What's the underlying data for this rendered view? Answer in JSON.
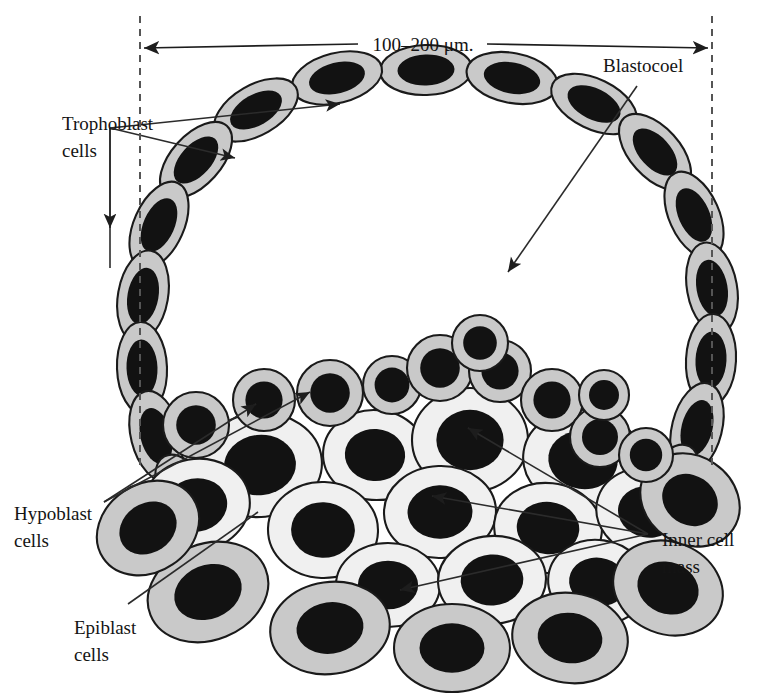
{
  "figure": {
    "background_color": "#ffffff"
  },
  "scale_bar": {
    "label": "100–200 μm.",
    "left_x": 140,
    "right_x": 712,
    "y": 48,
    "guide_left_x": 140,
    "guide_right_x": 712,
    "guide_top_y": 16,
    "guide_bottom_y": 470
  },
  "labels": {
    "trophoblast": {
      "line1": "Trophoblast",
      "line2": "cells",
      "x": 62,
      "y": 130
    },
    "blastocoel": {
      "line1": "Blastocoel",
      "x": 603,
      "y": 72
    },
    "hypoblast": {
      "line1": "Hypoblast",
      "line2": "cells",
      "x": 14,
      "y": 520
    },
    "epiblast": {
      "line1": "Epiblast",
      "line2": "cells",
      "x": 74,
      "y": 634
    },
    "inner_cell_mass": {
      "line1": "Inner cell",
      "line2": "mass",
      "x": 662,
      "y": 546
    }
  },
  "colors": {
    "cytoplasm_gray": "#c9c9c9",
    "cytoplasm_light": "#f0f0f0",
    "nucleus": "#121212",
    "outline": "#1a1a1a",
    "leader_line": "#2b2b2b",
    "dashed_guide": "#555555"
  },
  "chart_data": {
    "type": "diagram",
    "annotations": [
      "Trophoblast cells",
      "Blastocoel",
      "Hypoblast cells",
      "Epiblast cells",
      "Inner cell mass"
    ],
    "scale": "100–200 μm.",
    "structures": [
      {
        "name": "trophoblast",
        "count": 22,
        "cell_fill": "#c9c9c9",
        "shape": "tilted-ellipse-ring"
      },
      {
        "name": "blastocoel",
        "count": 1,
        "cell_fill": "#ffffff",
        "shape": "cavity"
      },
      {
        "name": "hypoblast",
        "count": 11,
        "cell_fill": "#c9c9c9",
        "shape": "small-round"
      },
      {
        "name": "inner-cell-mass",
        "count": 16,
        "cell_fill": "#f0f0f0",
        "shape": "large-round"
      },
      {
        "name": "epiblast",
        "count": 9,
        "cell_fill": "#c9c9c9",
        "shape": "large-ellipse"
      }
    ]
  },
  "trophoblast_cells": [
    {
      "cx": 426,
      "cy": 70,
      "rx": 46,
      "ry": 25,
      "rot": -2
    },
    {
      "cx": 512,
      "cy": 78,
      "rx": 46,
      "ry": 25,
      "rot": 11
    },
    {
      "cx": 594,
      "cy": 104,
      "rx": 46,
      "ry": 25,
      "rot": 26
    },
    {
      "cx": 655,
      "cy": 152,
      "rx": 46,
      "ry": 25,
      "rot": 48
    },
    {
      "cx": 694,
      "cy": 215,
      "rx": 46,
      "ry": 25,
      "rot": 66
    },
    {
      "cx": 712,
      "cy": 288,
      "rx": 46,
      "ry": 25,
      "rot": 80
    },
    {
      "cx": 711,
      "cy": 360,
      "rx": 46,
      "ry": 25,
      "rot": 93
    },
    {
      "cx": 697,
      "cy": 428,
      "rx": 46,
      "ry": 25,
      "rot": 104
    },
    {
      "cx": 668,
      "cy": 487,
      "rx": 46,
      "ry": 25,
      "rot": 118
    },
    {
      "cx": 337,
      "cy": 78,
      "rx": 46,
      "ry": 25,
      "rot": -14
    },
    {
      "cx": 256,
      "cy": 110,
      "rx": 46,
      "ry": 25,
      "rot": -30
    },
    {
      "cx": 196,
      "cy": 160,
      "rx": 46,
      "ry": 25,
      "rot": -48
    },
    {
      "cx": 159,
      "cy": 225,
      "rx": 46,
      "ry": 25,
      "rot": -66
    },
    {
      "cx": 143,
      "cy": 296,
      "rx": 46,
      "ry": 25,
      "rot": -80
    },
    {
      "cx": 142,
      "cy": 368,
      "rx": 46,
      "ry": 25,
      "rot": -92
    },
    {
      "cx": 156,
      "cy": 436,
      "rx": 46,
      "ry": 25,
      "rot": -104
    },
    {
      "cx": 186,
      "cy": 497,
      "rx": 46,
      "ry": 25,
      "rot": -118
    }
  ],
  "hypoblast_cells": [
    {
      "cx": 196,
      "cy": 425,
      "r": 33
    },
    {
      "cx": 264,
      "cy": 400,
      "r": 31
    },
    {
      "cx": 330,
      "cy": 393,
      "r": 33
    },
    {
      "cx": 392,
      "cy": 385,
      "r": 29
    },
    {
      "cx": 440,
      "cy": 368,
      "r": 33
    },
    {
      "cx": 500,
      "cy": 371,
      "r": 31
    },
    {
      "cx": 552,
      "cy": 400,
      "r": 31
    },
    {
      "cx": 600,
      "cy": 437,
      "r": 30
    },
    {
      "cx": 646,
      "cy": 455,
      "r": 27
    },
    {
      "cx": 480,
      "cy": 343,
      "r": 28
    },
    {
      "cx": 604,
      "cy": 395,
      "r": 25
    }
  ],
  "icm_cells": [
    {
      "cx": 260,
      "cy": 465,
      "rx": 62,
      "ry": 52,
      "rot": -6
    },
    {
      "cx": 375,
      "cy": 455,
      "rx": 52,
      "ry": 45,
      "rot": 4
    },
    {
      "cx": 470,
      "cy": 440,
      "rx": 58,
      "ry": 52,
      "rot": 0
    },
    {
      "cx": 583,
      "cy": 460,
      "rx": 60,
      "ry": 50,
      "rot": 8
    },
    {
      "cx": 196,
      "cy": 505,
      "rx": 54,
      "ry": 46,
      "rot": -10
    },
    {
      "cx": 323,
      "cy": 530,
      "rx": 55,
      "ry": 48,
      "rot": 2
    },
    {
      "cx": 440,
      "cy": 512,
      "rx": 56,
      "ry": 46,
      "rot": -2
    },
    {
      "cx": 548,
      "cy": 528,
      "rx": 54,
      "ry": 45,
      "rot": 6
    },
    {
      "cx": 648,
      "cy": 512,
      "rx": 52,
      "ry": 44,
      "rot": 12
    },
    {
      "cx": 388,
      "cy": 585,
      "rx": 52,
      "ry": 42,
      "rot": 0
    },
    {
      "cx": 492,
      "cy": 580,
      "rx": 54,
      "ry": 44,
      "rot": -4
    },
    {
      "cx": 598,
      "cy": 582,
      "rx": 50,
      "ry": 42,
      "rot": 8
    }
  ],
  "epiblast_cells": [
    {
      "cx": 208,
      "cy": 592,
      "rx": 62,
      "ry": 48,
      "rot": -22
    },
    {
      "cx": 330,
      "cy": 628,
      "rx": 60,
      "ry": 46,
      "rot": -8
    },
    {
      "cx": 452,
      "cy": 648,
      "rx": 58,
      "ry": 44,
      "rot": 0
    },
    {
      "cx": 570,
      "cy": 638,
      "rx": 58,
      "ry": 45,
      "rot": 8
    },
    {
      "cx": 668,
      "cy": 588,
      "rx": 56,
      "ry": 46,
      "rot": 22
    },
    {
      "cx": 148,
      "cy": 528,
      "rx": 54,
      "ry": 44,
      "rot": -34
    },
    {
      "cx": 690,
      "cy": 500,
      "rx": 52,
      "ry": 44,
      "rot": 34
    }
  ]
}
